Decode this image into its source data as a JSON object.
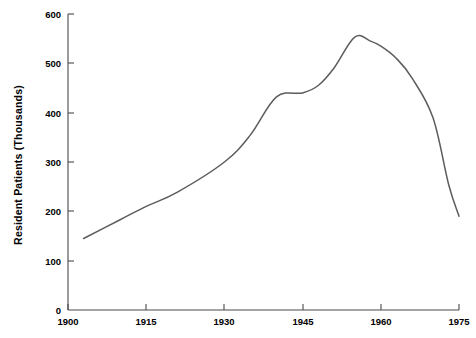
{
  "chart_data": {
    "type": "line",
    "title": "",
    "subtitle": "",
    "xlabel": "",
    "ylabel": "Resident Patients (Thousands)",
    "xlim": [
      1900,
      1975
    ],
    "ylim": [
      0,
      600
    ],
    "grid": false,
    "legend": false,
    "legend_position": "none",
    "x_ticks": [
      1900,
      1915,
      1930,
      1945,
      1960,
      1975
    ],
    "x_tick_labels": [
      "1900",
      "1915",
      "1930",
      "1945",
      "1960",
      "1975"
    ],
    "y_ticks": [
      0,
      100,
      200,
      300,
      400,
      500,
      600
    ],
    "y_tick_labels": [
      "0",
      "100",
      "200",
      "300",
      "400",
      "500",
      "600"
    ],
    "line_color": "#5c5c5c",
    "axis_color": "#4a4a4a",
    "background_color": "#ffffff",
    "series": [
      {
        "name": "Resident Patients",
        "x": [
          1903,
          1910,
          1915,
          1921,
          1930,
          1935,
          1940,
          1945,
          1948,
          1951,
          1955,
          1958,
          1960,
          1963,
          1966,
          1970,
          1973,
          1975
        ],
        "values": [
          145,
          183,
          210,
          239,
          300,
          355,
          432,
          440,
          455,
          490,
          553,
          545,
          535,
          510,
          470,
          390,
          255,
          190
        ]
      }
    ],
    "annotations": []
  }
}
